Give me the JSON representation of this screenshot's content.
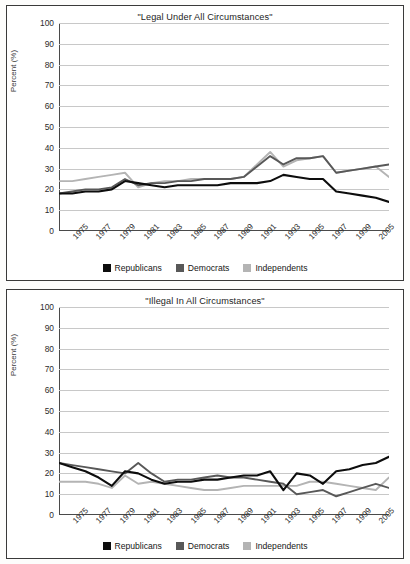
{
  "figure": {
    "panels": [
      "legal",
      "illegal"
    ]
  },
  "legend": {
    "items": [
      {
        "label": "Republicans",
        "color": "#0d0d0d"
      },
      {
        "label": "Democrats",
        "color": "#585858"
      },
      {
        "label": "Independents",
        "color": "#b4b4b4"
      }
    ]
  },
  "axis": {
    "ylabel": "Percent (%)",
    "yticks": [
      "0",
      "10",
      "20",
      "30",
      "40",
      "50",
      "60",
      "70",
      "80",
      "90",
      "100"
    ],
    "xticks": [
      "1975",
      "1977",
      "1979",
      "1981",
      "1983",
      "1985",
      "1987",
      "1989",
      "1991",
      "1993",
      "1995",
      "1997",
      "1999",
      "2005"
    ]
  },
  "chart_data": [
    {
      "type": "line",
      "title": "\"Legal Under All Circumstances\"",
      "xlabel": "",
      "ylabel": "Percent (%)",
      "ylim": [
        0,
        100
      ],
      "grid": true,
      "legend_position": "bottom",
      "categories": [
        "1975",
        "1976",
        "1977",
        "1978",
        "1979",
        "1980",
        "1981",
        "1982",
        "1983",
        "1984",
        "1985",
        "1986",
        "1987",
        "1988",
        "1989",
        "1990",
        "1991",
        "1992",
        "1993",
        "1994",
        "1995",
        "1996",
        "1997",
        "1998",
        "1999",
        "2005"
      ],
      "series": [
        {
          "name": "Republicans",
          "color": "#0d0d0d",
          "values": [
            18,
            18,
            19,
            19,
            20,
            24,
            23,
            22,
            21,
            22,
            22,
            22,
            22,
            23,
            23,
            23,
            24,
            27,
            26,
            25,
            25,
            19,
            18,
            17,
            16,
            14
          ]
        },
        {
          "name": "Democrats",
          "color": "#585858",
          "values": [
            18,
            19,
            20,
            20,
            21,
            25,
            22,
            23,
            23,
            24,
            24,
            25,
            25,
            25,
            26,
            31,
            36,
            32,
            35,
            35,
            36,
            28,
            29,
            30,
            31,
            32
          ]
        },
        {
          "name": "Independents",
          "color": "#b4b4b4",
          "values": [
            24,
            24,
            25,
            26,
            27,
            28,
            21,
            23,
            24,
            24,
            25,
            25,
            25,
            25,
            26,
            32,
            38,
            31,
            34,
            35,
            36,
            28,
            29,
            30,
            31,
            26
          ]
        }
      ]
    },
    {
      "type": "line",
      "title": "\"Illegal In All Circumstances\"",
      "xlabel": "",
      "ylabel": "Percent (%)",
      "ylim": [
        0,
        100
      ],
      "grid": true,
      "legend_position": "bottom",
      "categories": [
        "1975",
        "1976",
        "1977",
        "1978",
        "1979",
        "1980",
        "1981",
        "1982",
        "1983",
        "1984",
        "1985",
        "1986",
        "1987",
        "1988",
        "1989",
        "1990",
        "1991",
        "1992",
        "1993",
        "1994",
        "1995",
        "1996",
        "1997",
        "1998",
        "1999",
        "2005"
      ],
      "series": [
        {
          "name": "Republicans",
          "color": "#0d0d0d",
          "values": [
            25,
            23,
            21,
            18,
            14,
            21,
            20,
            17,
            15,
            16,
            16,
            17,
            17,
            18,
            19,
            19,
            21,
            12,
            20,
            19,
            15,
            21,
            22,
            24,
            25,
            28
          ]
        },
        {
          "name": "Democrats",
          "color": "#585858",
          "values": [
            25,
            24,
            23,
            22,
            21,
            20,
            25,
            20,
            16,
            17,
            17,
            18,
            19,
            18,
            18,
            17,
            16,
            15,
            10,
            11,
            12,
            9,
            11,
            13,
            15,
            13
          ]
        },
        {
          "name": "Independents",
          "color": "#b4b4b4",
          "values": [
            16,
            16,
            16,
            15,
            13,
            19,
            15,
            16,
            15,
            14,
            13,
            12,
            12,
            13,
            14,
            14,
            14,
            14,
            14,
            16,
            16,
            15,
            14,
            13,
            12,
            18
          ]
        }
      ]
    }
  ]
}
